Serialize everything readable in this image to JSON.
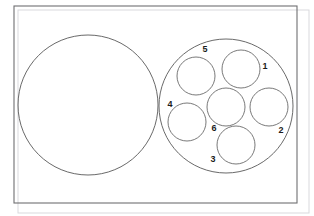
{
  "figure": {
    "canvas": {
      "width": 314,
      "height": 216
    },
    "background_color": "#ffffff",
    "stroke_color": "#585858",
    "label_color": "#1b1b1b"
  },
  "frame": {
    "name": "bounding-rectangle",
    "x": 14,
    "y": 6,
    "width": 283,
    "height": 197,
    "stroke_color": "#6f6f72"
  },
  "frame_ghost": {
    "name": "bounding-rectangle-ghost",
    "x": 18,
    "y": 10,
    "width": 291,
    "height": 203,
    "stroke_color": "#d9d9dd"
  },
  "big_circles": [
    {
      "name": "left-large-circle",
      "label": "",
      "cx": 88,
      "cy": 105,
      "r": 70
    },
    {
      "name": "right-large-circle",
      "label": "",
      "cx": 226,
      "cy": 106,
      "r": 67
    }
  ],
  "inner_circles": [
    {
      "name": "inner-circle-1",
      "label": "1",
      "cx": 241,
      "cy": 69,
      "r": 19,
      "label_x": 265,
      "label_y": 67
    },
    {
      "name": "inner-circle-2",
      "label": "2",
      "cx": 269,
      "cy": 107,
      "r": 19,
      "label_x": 281,
      "label_y": 131
    },
    {
      "name": "inner-circle-3",
      "label": "3",
      "cx": 236,
      "cy": 145,
      "r": 19,
      "label_x": 213,
      "label_y": 160
    },
    {
      "name": "inner-circle-4",
      "label": "4",
      "cx": 187,
      "cy": 122,
      "r": 19,
      "label_x": 170,
      "label_y": 105
    },
    {
      "name": "inner-circle-5",
      "label": "5",
      "cx": 196,
      "cy": 76,
      "r": 19,
      "label_x": 205,
      "label_y": 50
    },
    {
      "name": "inner-circle-6",
      "label": "6",
      "cx": 226,
      "cy": 107,
      "r": 19,
      "label_x": 214,
      "label_y": 129
    }
  ],
  "chart_data": {
    "type": "diagram",
    "labels": [
      "1",
      "2",
      "3",
      "4",
      "5",
      "6"
    ],
    "shape_count": 8,
    "large_circle_count": 2,
    "inner_circle_count": 6
  }
}
